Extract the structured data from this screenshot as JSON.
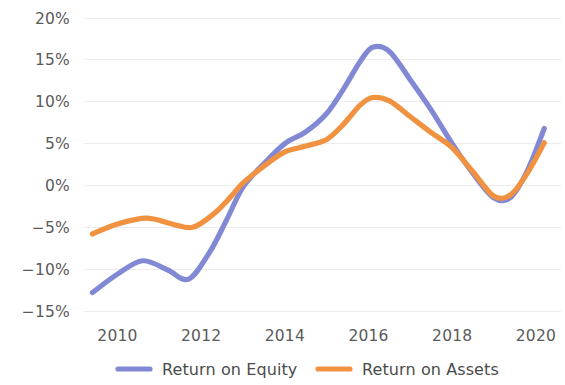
{
  "chart_data": {
    "type": "line",
    "title": "",
    "subtitle": "",
    "xlabel": "",
    "ylabel": "",
    "grid": true,
    "grid_axis": "y",
    "legend_position": "bottom",
    "xlim": [
      2009.2,
      2020.6
    ],
    "ylim": [
      -15,
      20
    ],
    "x_tick_labels": [
      "2010",
      "2012",
      "2014",
      "2016",
      "2018",
      "2020"
    ],
    "x_ticks": [
      2010,
      2012,
      2014,
      2016,
      2018,
      2020
    ],
    "y_tick_labels": [
      "20%",
      "15%",
      "10%",
      "5%",
      "0%",
      "−5%",
      "−10%",
      "−15%"
    ],
    "y_ticks": [
      20,
      15,
      10,
      5,
      0,
      -5,
      -10,
      -15
    ],
    "series": [
      {
        "name": "Return on Equity",
        "color": "#8289d4",
        "x": [
          2009.4,
          2010.0,
          2010.6,
          2011.2,
          2011.7,
          2012.2,
          2012.6,
          2013.0,
          2013.5,
          2014.0,
          2014.5,
          2015.0,
          2015.4,
          2015.8,
          2016.1,
          2016.5,
          2017.0,
          2017.5,
          2018.0,
          2018.5,
          2019.0,
          2019.4,
          2019.8,
          2020.2
        ],
        "values": [
          -12.8,
          -10.6,
          -9.0,
          -10.1,
          -11.2,
          -8.0,
          -4.2,
          -0.2,
          2.6,
          5.0,
          6.4,
          8.6,
          11.5,
          14.8,
          16.5,
          16.0,
          12.6,
          9.0,
          5.0,
          1.4,
          -1.5,
          -1.4,
          1.8,
          6.8
        ]
      },
      {
        "name": "Return on Assets",
        "color": "#f0923f",
        "x": [
          2009.4,
          2010.0,
          2010.7,
          2011.3,
          2011.8,
          2012.3,
          2012.7,
          2013.0,
          2013.5,
          2014.0,
          2014.5,
          2015.0,
          2015.4,
          2015.8,
          2016.1,
          2016.5,
          2017.0,
          2017.5,
          2018.0,
          2018.5,
          2019.0,
          2019.4,
          2019.8,
          2020.2
        ],
        "values": [
          -5.8,
          -4.6,
          -3.9,
          -4.6,
          -5.0,
          -3.4,
          -1.4,
          0.3,
          2.3,
          4.0,
          4.7,
          5.5,
          7.3,
          9.6,
          10.5,
          10.1,
          8.2,
          6.3,
          4.5,
          1.6,
          -1.3,
          -1.1,
          1.5,
          5.1
        ]
      }
    ]
  },
  "legend": {
    "items": [
      {
        "label": "Return on Equity",
        "color": "#8289d4"
      },
      {
        "label": "Return on Assets",
        "color": "#f0923f"
      }
    ]
  },
  "axes": {
    "y_labels": [
      "20%",
      "15%",
      "10%",
      "5%",
      "0%",
      "−5%",
      "−10%",
      "−15%"
    ],
    "x_labels": [
      "2010",
      "2012",
      "2014",
      "2016",
      "2018",
      "2020"
    ]
  },
  "colors": {
    "series_equity": "#8289d4",
    "series_assets": "#f0923f",
    "gridline": "#ececec",
    "text": "#4b4b4b",
    "background": "#ffffff"
  }
}
